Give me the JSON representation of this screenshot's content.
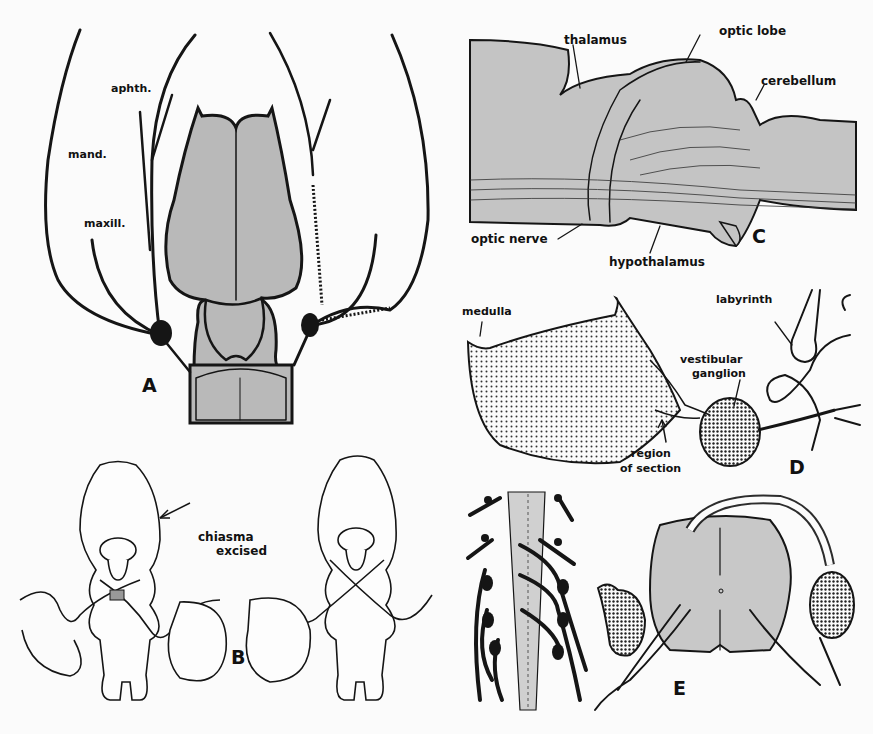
{
  "figure": {
    "panels": [
      {
        "id": "A",
        "letter": "A",
        "description": "Dorsal view of brain with cranial nerve branches (ophthalmic, mandibular, maxillary) arising from ganglia",
        "labels": {
          "ophthalmic": "aphth.",
          "mandibular": "mand.",
          "maxillary": "maxill."
        }
      },
      {
        "id": "B",
        "letter": "B",
        "description": "Two ventral views of brain with eyes; optic chiasma excised in left specimen",
        "labels": {
          "chiasma_line1": "chiasma",
          "chiasma_line2": "excised"
        }
      },
      {
        "id": "C",
        "letter": "C",
        "description": "Lateral view section showing optic pathways",
        "labels": {
          "thalamus": "thalamus",
          "optic_lobe": "optic lobe",
          "cerebellum": "cerebellum",
          "optic_nerve": "optic nerve",
          "hypothalamus": "hypothalamus"
        }
      },
      {
        "id": "D",
        "letter": "D",
        "description": "Medulla with vestibular ganglion and labyrinth",
        "labels": {
          "medulla": "medulla",
          "labyrinth": "labyrinth",
          "vestibular_line1": "vestibular",
          "vestibular_line2": "ganglion",
          "region_line1": "region",
          "region_line2": "of section"
        }
      },
      {
        "id": "E",
        "letter": "E",
        "description": "Spinal cord with dorsal root ganglia, longitudinal and cross-section views",
        "labels": {}
      }
    ],
    "colors": {
      "ink": "#151515",
      "tissue_fill": "#b9b9b9",
      "tissue_light": "#d4d4d4",
      "background": "#fbfbfb"
    }
  }
}
